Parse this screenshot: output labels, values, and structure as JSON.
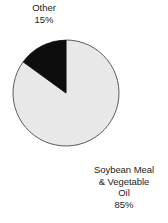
{
  "chart_data": {
    "type": "pie",
    "title": "",
    "categories": [
      "Soybean Meal & Vegetable Oil",
      "Other"
    ],
    "values": [
      85,
      15
    ],
    "unit": "%",
    "legend_position": "none",
    "labels": [
      {
        "name": "other-slice-label",
        "lines": [
          "Other",
          "15%"
        ],
        "value": 15,
        "color": "#0d0d0d"
      },
      {
        "name": "soybean-slice-label",
        "lines": [
          "Soybean Meal",
          "& Vegetable",
          "Oil",
          "85%"
        ],
        "value": 85,
        "color": "#e8e8e8"
      }
    ],
    "slices": [
      {
        "label": "Soybean Meal & Vegetable Oil",
        "percent": 85,
        "fill": "#e8e8e8",
        "stroke": "#5a5a5a"
      },
      {
        "label": "Other",
        "percent": 15,
        "fill": "#0d0d0d",
        "stroke": "#0d0d0d"
      }
    ],
    "geometry": {
      "center_x": 66,
      "center_y": 93,
      "radius": 53,
      "start_angle_deg": 0,
      "direction": "counterclockwise"
    },
    "colors": {
      "background": "#ffffff",
      "text": "#1c1c1c",
      "slice_light": "#e8e8e8",
      "slice_dark": "#0d0d0d",
      "outline": "#5a5a5a"
    }
  },
  "labels": {
    "other": {
      "line1": "Other",
      "line2": "15%"
    },
    "soybean": {
      "line1": "Soybean Meal",
      "line2": "& Vegetable",
      "line3": "Oil",
      "line4": "85%"
    }
  }
}
